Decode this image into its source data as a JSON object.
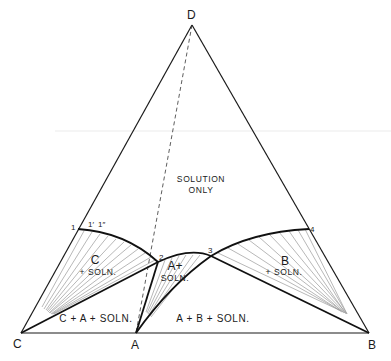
{
  "diagram": {
    "type": "ternary-phase-diagram",
    "vertices": {
      "D": {
        "label": "D",
        "x": 192,
        "y": 25
      },
      "C": {
        "label": "C",
        "x": 21,
        "y": 333
      },
      "A": {
        "label": "A",
        "x": 136,
        "y": 333
      },
      "B": {
        "label": "B",
        "x": 369,
        "y": 333
      }
    },
    "points": [
      {
        "id": "1",
        "label": "1",
        "x": 78,
        "y": 229
      },
      {
        "id": "1p",
        "label": "1′",
        "x": 90,
        "y": 229
      },
      {
        "id": "1pp",
        "label": "1″",
        "x": 100,
        "y": 230
      },
      {
        "id": "2",
        "label": "2",
        "x": 158,
        "y": 262
      },
      {
        "id": "3",
        "label": "3",
        "x": 211,
        "y": 256
      },
      {
        "id": "4",
        "label": "4",
        "x": 309,
        "y": 229
      }
    ],
    "regions": {
      "solution_only": {
        "line1": "SOLUTION",
        "line2": "ONLY"
      },
      "c_soln": {
        "line1": "C",
        "line2": "+ SOLN."
      },
      "a_soln": {
        "line1": "A+",
        "line2": "SOLN."
      },
      "b_soln": {
        "line1": "B",
        "line2": "+ SOLN."
      },
      "c_a_soln": {
        "label": "C + A + SOLN."
      },
      "a_b_soln": {
        "label": "A + B + SOLN."
      }
    },
    "colors": {
      "line": "#1a1a1a",
      "tie_line": "#9a9a9a",
      "background": "#ffffff"
    }
  }
}
